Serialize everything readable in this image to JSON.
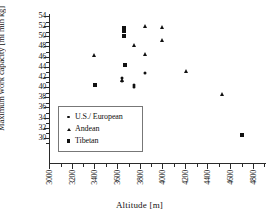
{
  "chart_data": {
    "type": "scatter",
    "title": "",
    "xlabel": "Altitude [m]",
    "ylabel": "Maximum work capacity [ml min kg]",
    "xlim": [
      3000,
      4900
    ],
    "ylim": [
      28,
      54
    ],
    "xticks": [
      3000,
      3200,
      3400,
      3600,
      3800,
      4000,
      4200,
      4400,
      4600,
      4800
    ],
    "yticks": [
      30,
      32,
      34,
      36,
      38,
      40,
      42,
      44,
      46,
      48,
      50,
      52,
      54
    ],
    "grid": false,
    "legend_position": "lower-left",
    "series": [
      {
        "name": "U.S./ European",
        "marker": "circle",
        "points": [
          {
            "x": 3640,
            "y": 41.8
          },
          {
            "x": 3640,
            "y": 41.2
          },
          {
            "x": 3745,
            "y": 40.4
          },
          {
            "x": 3745,
            "y": 40.0
          },
          {
            "x": 3840,
            "y": 42.8
          }
        ]
      },
      {
        "name": "Andean",
        "marker": "triangle",
        "points": [
          {
            "x": 3390,
            "y": 46.4
          },
          {
            "x": 3640,
            "y": 41.4
          },
          {
            "x": 3745,
            "y": 48.2
          },
          {
            "x": 3840,
            "y": 52.0
          },
          {
            "x": 3840,
            "y": 46.5
          },
          {
            "x": 3990,
            "y": 51.9
          },
          {
            "x": 3990,
            "y": 49.2
          },
          {
            "x": 4200,
            "y": 43.2
          },
          {
            "x": 4520,
            "y": 38.7
          }
        ]
      },
      {
        "name": "Tibetan",
        "marker": "square",
        "points": [
          {
            "x": 3400,
            "y": 40.5
          },
          {
            "x": 3650,
            "y": 51.6
          },
          {
            "x": 3650,
            "y": 51.0
          },
          {
            "x": 3650,
            "y": 50.1
          },
          {
            "x": 3660,
            "y": 44.4
          },
          {
            "x": 4700,
            "y": 30.5
          }
        ]
      }
    ]
  },
  "legend": {
    "items": [
      {
        "marker": "circle",
        "label": "U.S./ European"
      },
      {
        "marker": "triangle",
        "label": "Andean"
      },
      {
        "marker": "square",
        "label": "Tibetan"
      }
    ]
  }
}
